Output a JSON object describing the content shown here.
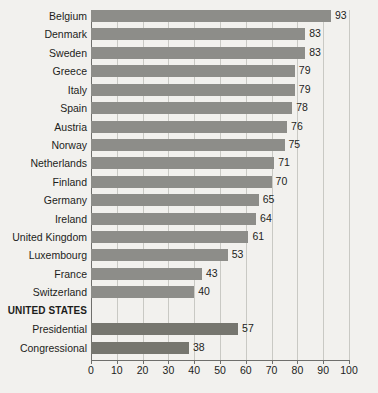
{
  "chart_data": {
    "type": "bar",
    "orientation": "horizontal",
    "title": "",
    "xlabel": "",
    "ylabel": "",
    "xlim": [
      0,
      100
    ],
    "xticks": [
      0,
      10,
      20,
      30,
      40,
      50,
      60,
      70,
      80,
      90,
      100
    ],
    "grid": true,
    "legend": null,
    "colors": {
      "bar": "#8d8d89",
      "bar_united_states": "#76766f",
      "background": "#f2f1ee",
      "axis": "#6f6f6c",
      "gridline": "#c9c9c4",
      "text": "#1d1d1b"
    },
    "categories": [
      "Belgium",
      "Denmark",
      "Sweden",
      "Greece",
      "Italy",
      "Spain",
      "Austria",
      "Norway",
      "Netherlands",
      "Finland",
      "Germany",
      "Ireland",
      "United Kingdom",
      "Luxembourg",
      "France",
      "Switzerland",
      "UNITED STATES",
      "Presidential",
      "Congressional"
    ],
    "values": [
      93,
      83,
      83,
      79,
      79,
      78,
      76,
      75,
      71,
      70,
      65,
      64,
      61,
      53,
      43,
      40,
      null,
      57,
      38
    ],
    "rows": [
      {
        "label": "Belgium",
        "value": 93,
        "value_text": "93",
        "group": false,
        "us": false
      },
      {
        "label": "Denmark",
        "value": 83,
        "value_text": "83",
        "group": false,
        "us": false
      },
      {
        "label": "Sweden",
        "value": 83,
        "value_text": "83",
        "group": false,
        "us": false
      },
      {
        "label": "Greece",
        "value": 79,
        "value_text": "79",
        "group": false,
        "us": false
      },
      {
        "label": "Italy",
        "value": 79,
        "value_text": "79",
        "group": false,
        "us": false
      },
      {
        "label": "Spain",
        "value": 78,
        "value_text": "78",
        "group": false,
        "us": false
      },
      {
        "label": "Austria",
        "value": 76,
        "value_text": "76",
        "group": false,
        "us": false
      },
      {
        "label": "Norway",
        "value": 75,
        "value_text": "75",
        "group": false,
        "us": false
      },
      {
        "label": "Netherlands",
        "value": 71,
        "value_text": "71",
        "group": false,
        "us": false
      },
      {
        "label": "Finland",
        "value": 70,
        "value_text": "70",
        "group": false,
        "us": false
      },
      {
        "label": "Germany",
        "value": 65,
        "value_text": "65",
        "group": false,
        "us": false
      },
      {
        "label": "Ireland",
        "value": 64,
        "value_text": "64",
        "group": false,
        "us": false
      },
      {
        "label": "United Kingdom",
        "value": 61,
        "value_text": "61",
        "group": false,
        "us": false
      },
      {
        "label": "Luxembourg",
        "value": 53,
        "value_text": "53",
        "group": false,
        "us": false
      },
      {
        "label": "France",
        "value": 43,
        "value_text": "43",
        "group": false,
        "us": false
      },
      {
        "label": "Switzerland",
        "value": 40,
        "value_text": "40",
        "group": false,
        "us": false
      },
      {
        "label": "UNITED STATES",
        "value": null,
        "value_text": "",
        "group": true,
        "us": false
      },
      {
        "label": "Presidential",
        "value": 57,
        "value_text": "57",
        "group": false,
        "us": true
      },
      {
        "label": "Congressional",
        "value": 38,
        "value_text": "38",
        "group": false,
        "us": true
      }
    ]
  }
}
